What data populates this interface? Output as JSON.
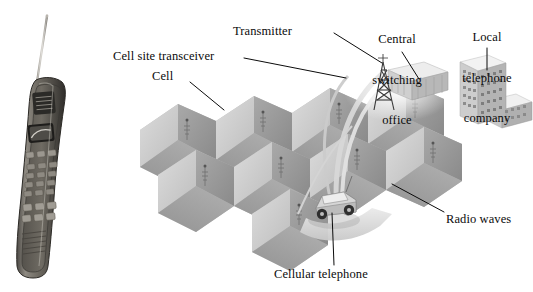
{
  "figure": {
    "kind": "cellular-network-diagram",
    "background_color": "#ffffff",
    "ink_color": "#0b0b0b",
    "cell_fill_light": "#d2d2d2",
    "cell_fill_mid": "#b4b4b4",
    "cell_fill_dark": "#8f8f8f",
    "phone_body_color": "#6e6a63",
    "building_color": "#c9c9c9"
  },
  "labels": {
    "cell_site_transceiver": "Cell site transceiver",
    "cell": "Cell",
    "transmitter": "Transmitter",
    "central_switching_office": "Central\nswitching\noffice",
    "central_switching_office_line1": "Central",
    "central_switching_office_line2": "switching",
    "central_switching_office_line3": "office",
    "local_telephone_company": "Local\ntelephone\ncompany",
    "local_telephone_company_line1": "Local",
    "local_telephone_company_line2": "telephone",
    "local_telephone_company_line3": "company",
    "radio_waves": "Radio waves",
    "cellular_telephone": "Cellular telephone"
  },
  "objects": {
    "handset": "vintage-brick-mobile-phone",
    "handset_antenna": "extended-whip-antenna",
    "handset_screen": "lcd-display",
    "handset_keypad_rows": 4,
    "handset_keypad_cols": 3,
    "handset_function_buttons": 3,
    "cell_grid_count": 9,
    "cell_shape": "hexagon",
    "tower": "lattice-transmitter-tower",
    "switching_office": "low-rise-building",
    "telephone_company": "office-tower-with-wing",
    "vehicle": "car-with-cellular-telephone",
    "radio_wave_arcs": 3
  }
}
